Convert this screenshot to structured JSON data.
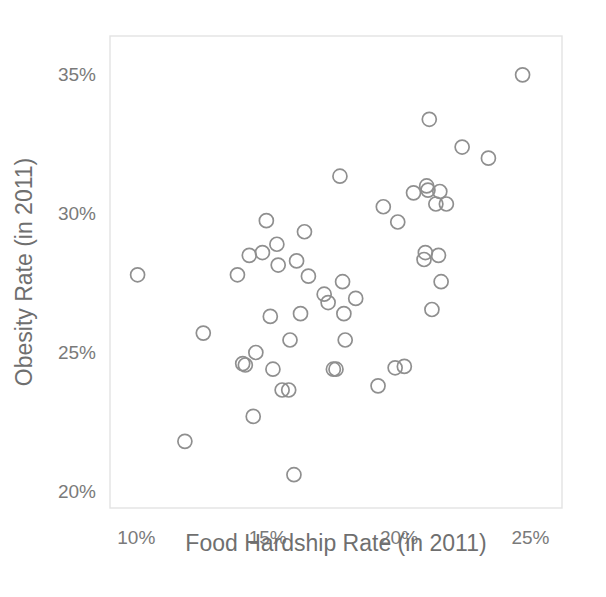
{
  "chart_data": {
    "type": "scatter",
    "title": "",
    "subtitle": "",
    "xlabel": "Food Hardship Rate (in 2011)",
    "ylabel": "Obesity Rate (in 2011)",
    "xlim": [
      9.0,
      26.2
    ],
    "ylim": [
      19.4,
      36.4
    ],
    "xticks": [
      10,
      15,
      20,
      25
    ],
    "xtick_labels": [
      "10%",
      "15%",
      "20%",
      "25%"
    ],
    "yticks": [
      20,
      25,
      30,
      35
    ],
    "ytick_labels": [
      "20%",
      "25%",
      "30%",
      "35%"
    ],
    "grid": false,
    "legend": null,
    "legend_position": "none",
    "marker": {
      "shape": "circle-open",
      "radius_px": 7,
      "stroke": "#8f8f8f",
      "fill": "none",
      "stroke_width": 1.7
    },
    "series": [
      {
        "name": "States",
        "points": [
          {
            "x": 10.05,
            "y": 27.8
          },
          {
            "x": 11.85,
            "y": 21.8
          },
          {
            "x": 12.55,
            "y": 25.7
          },
          {
            "x": 13.85,
            "y": 27.8
          },
          {
            "x": 14.05,
            "y": 24.6
          },
          {
            "x": 14.15,
            "y": 24.55
          },
          {
            "x": 14.3,
            "y": 28.5
          },
          {
            "x": 14.45,
            "y": 22.7
          },
          {
            "x": 14.55,
            "y": 25.0
          },
          {
            "x": 14.8,
            "y": 28.6
          },
          {
            "x": 14.95,
            "y": 29.75
          },
          {
            "x": 15.1,
            "y": 26.3
          },
          {
            "x": 15.2,
            "y": 24.4
          },
          {
            "x": 15.35,
            "y": 28.9
          },
          {
            "x": 15.4,
            "y": 28.15
          },
          {
            "x": 15.55,
            "y": 23.65
          },
          {
            "x": 15.8,
            "y": 23.65
          },
          {
            "x": 15.85,
            "y": 25.45
          },
          {
            "x": 16.0,
            "y": 20.6
          },
          {
            "x": 16.1,
            "y": 28.3
          },
          {
            "x": 16.25,
            "y": 26.4
          },
          {
            "x": 16.4,
            "y": 29.35
          },
          {
            "x": 16.55,
            "y": 27.75
          },
          {
            "x": 17.15,
            "y": 27.1
          },
          {
            "x": 17.3,
            "y": 26.8
          },
          {
            "x": 17.5,
            "y": 24.4
          },
          {
            "x": 17.6,
            "y": 24.4
          },
          {
            "x": 17.75,
            "y": 31.35
          },
          {
            "x": 17.85,
            "y": 27.55
          },
          {
            "x": 17.9,
            "y": 26.4
          },
          {
            "x": 17.95,
            "y": 25.45
          },
          {
            "x": 18.35,
            "y": 26.95
          },
          {
            "x": 19.2,
            "y": 23.8
          },
          {
            "x": 19.4,
            "y": 30.25
          },
          {
            "x": 19.85,
            "y": 24.45
          },
          {
            "x": 19.95,
            "y": 29.7
          },
          {
            "x": 20.2,
            "y": 24.5
          },
          {
            "x": 20.55,
            "y": 30.75
          },
          {
            "x": 20.95,
            "y": 28.35
          },
          {
            "x": 21.0,
            "y": 28.6
          },
          {
            "x": 21.05,
            "y": 31.0
          },
          {
            "x": 21.1,
            "y": 30.85
          },
          {
            "x": 21.15,
            "y": 33.4
          },
          {
            "x": 21.25,
            "y": 26.55
          },
          {
            "x": 21.4,
            "y": 30.35
          },
          {
            "x": 21.5,
            "y": 28.5
          },
          {
            "x": 21.55,
            "y": 30.8
          },
          {
            "x": 21.6,
            "y": 27.55
          },
          {
            "x": 21.8,
            "y": 30.35
          },
          {
            "x": 22.4,
            "y": 32.4
          },
          {
            "x": 23.4,
            "y": 32.0
          },
          {
            "x": 24.7,
            "y": 35.0
          }
        ]
      }
    ],
    "n_points": 52,
    "colors": {
      "marker_stroke": "#8f8f8f",
      "frame": "#e3e3e3",
      "text": "#6f6f6f",
      "background": "#ffffff"
    }
  },
  "plot_geometry": {
    "left_px": 110,
    "right_px": 562,
    "top_px": 36,
    "bottom_px": 508
  }
}
